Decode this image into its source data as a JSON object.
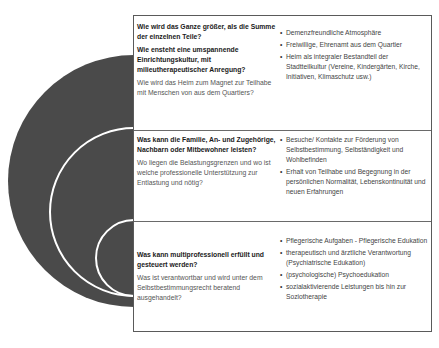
{
  "colors": {
    "circle_fill": "#4a4a4a",
    "ring_stroke": "#ffffff",
    "border": "#5a5a5a"
  },
  "rows": [
    {
      "questions": [
        "Wie wird das Ganze größer, als die Summe der einzelnen Teile?",
        "Wie ensteht eine umspannende Einrichtungskultur, mit milieutherapeutischer Anregung?"
      ],
      "subtext": "Wie wird das Heim zum Magnet zur Teilhabe mit Menschen von aus dem Quartiers?",
      "bullets": [
        "Demenzfreundliche Atmosphäre",
        "Freiwillige, Ehrenamt aus dem Quartier",
        "Heim als integraler Bestandteil der Stadtteilkultur (Vereine, Kindergärten, Kirche, Initiativen, Klimaschutz usw.)"
      ]
    },
    {
      "questions": [
        "Was kann die Familie, An- und Zugehörige, Nachbarn oder Mitbewohner  leisten?"
      ],
      "subtext": "Wo liegen die Belastungsgrenzen und wo ist welche professionelle Unterstützung zur Entlastung und nötig?",
      "bullets": [
        "Besuche/ Kontakte zur Förderung von Selbstbestimmung, Selbständigkeit und Wohlbefinden",
        "Erhalt von Teilhabe und Begegnung in der persönlichen Normalität, Lebenskontinuität und neuen Erfahrungen"
      ]
    },
    {
      "questions": [
        "Was kann multiprofessionell erfüllt und gesteuert werden?"
      ],
      "subtext": "Was ist verantwortbar und wird unter dem Selbstbestimmungsrecht beratend ausgehandelt?",
      "bullets": [
        "Pflegerische Aufgaben - Pflegerische Edukation",
        "therapeutisch und ärztliche Verantwortung  (Psychiatrische Edukation)",
        "(psychologische) Psychoedukation",
        "sozialaktivierende Leistungen bis hin zur Soziotherapie"
      ]
    }
  ]
}
